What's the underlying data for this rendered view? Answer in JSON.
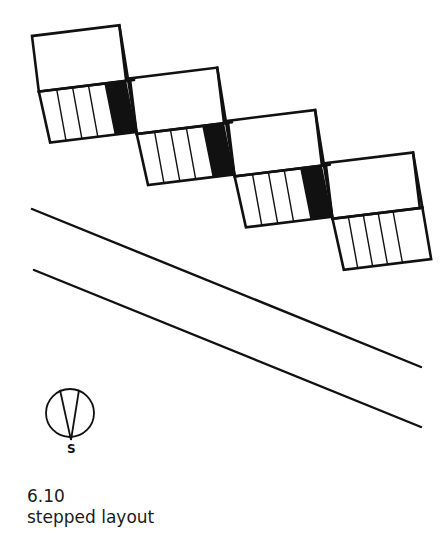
{
  "figure": {
    "number": "6.10",
    "title": "stepped layout"
  },
  "compass": {
    "label": "S",
    "icon": "north-arrow-compass-icon"
  },
  "drawing": {
    "type": "site-plan",
    "description": "Four stepped dwelling units arranged diagonally along a road",
    "stroke_color": "#111111",
    "fill_color": "#111111",
    "units": [
      {
        "id": 1,
        "stripe_lines": 3,
        "has_black_block": true
      },
      {
        "id": 2,
        "stripe_lines": 3,
        "has_black_block": true
      },
      {
        "id": 3,
        "stripe_lines": 3,
        "has_black_block": true
      },
      {
        "id": 4,
        "stripe_lines": 4,
        "has_black_block": false
      }
    ],
    "road_lines": 2
  }
}
